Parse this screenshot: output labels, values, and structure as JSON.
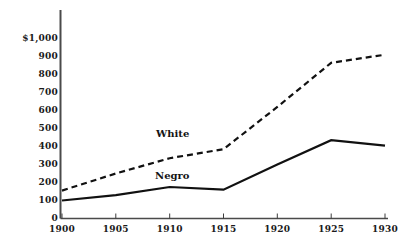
{
  "chart_data": {
    "type": "line",
    "title": "",
    "xlabel": "",
    "ylabel": "",
    "x": [
      1900,
      1905,
      1910,
      1915,
      1920,
      1925,
      1930
    ],
    "xtick_labels": [
      "1900",
      "1905",
      "1910",
      "1915",
      "1920",
      "1925",
      "1930"
    ],
    "ytick_labels": [
      "0",
      "100",
      "200",
      "300",
      "400",
      "500",
      "600",
      "700",
      "800",
      "900",
      "$1,000"
    ],
    "ytick_values": [
      0,
      100,
      200,
      300,
      400,
      500,
      600,
      700,
      800,
      900,
      1000
    ],
    "xlim": [
      1900,
      1930
    ],
    "ylim": [
      0,
      1000
    ],
    "grid": false,
    "legend_position": "inline-annotation",
    "series": [
      {
        "name": "White",
        "style": "dashed",
        "color": "#111111",
        "values": [
          155,
          250,
          335,
          385,
          620,
          865,
          910
        ]
      },
      {
        "name": "Negro",
        "style": "solid",
        "color": "#111111",
        "values": [
          100,
          130,
          175,
          160,
          300,
          435,
          405
        ]
      }
    ],
    "annotations": [
      {
        "text": "White",
        "x": 1914,
        "y": 470
      },
      {
        "text": "Negro",
        "x": 1913,
        "y": 235
      }
    ]
  },
  "axis": {
    "currency_prefix_label": "$1,000",
    "axis_color": "#3d3d3d"
  }
}
